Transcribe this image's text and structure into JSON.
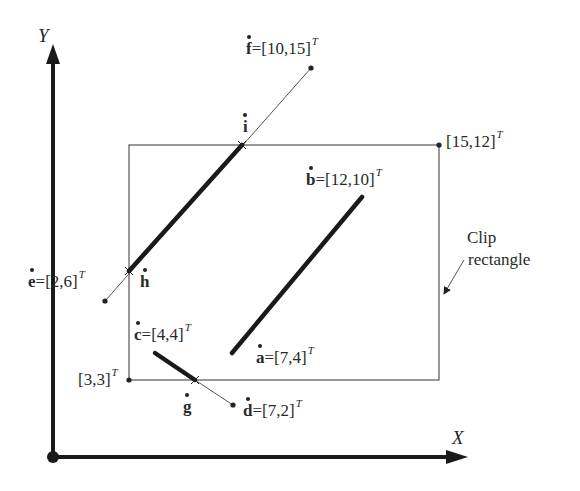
{
  "axes": {
    "x_label": "X",
    "y_label": "Y"
  },
  "clip_rectangle": {
    "label_line1": "Clip",
    "label_line2": "rectangle",
    "min_corner": "[3,3]",
    "max_corner": "[15,12]",
    "superscript": "T"
  },
  "points": {
    "a": {
      "name": "a",
      "value": "=[7,4]"
    },
    "b": {
      "name": "b",
      "value": "=[12,10]"
    },
    "c": {
      "name": "c",
      "value": "=[4,4]"
    },
    "d": {
      "name": "d",
      "value": "=[7,2]"
    },
    "e": {
      "name": "e",
      "value": "=[2,6]"
    },
    "f": {
      "name": "f",
      "value": "=[10,15]"
    },
    "g": {
      "name": "g"
    },
    "h": {
      "name": "h"
    },
    "i": {
      "name": "i"
    }
  },
  "segments": [
    {
      "from": "a",
      "to": "b",
      "clipped": "fully inside"
    },
    {
      "from": "c",
      "to": "d",
      "clipped_to": "c-g"
    },
    {
      "from": "e",
      "to": "f",
      "clipped_to": "h-i"
    }
  ],
  "colors": {
    "stroke": "#222222",
    "thin_stroke": "#555555",
    "background": "#ffffff"
  }
}
